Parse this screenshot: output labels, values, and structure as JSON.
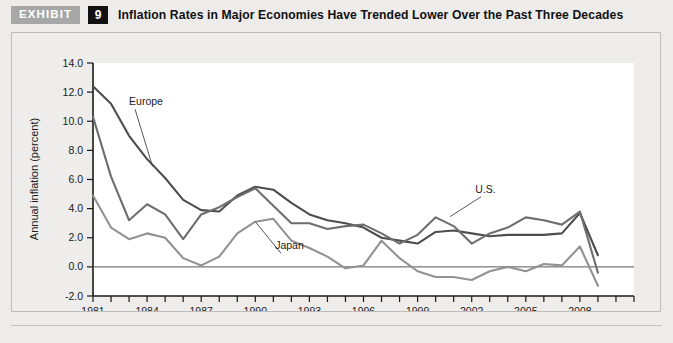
{
  "header": {
    "exhibit_label": "EXHIBIT",
    "exhibit_number": "9",
    "title": "Inflation Rates in Major Economies Have Trended Lower Over the Past Three Decades"
  },
  "colors": {
    "europe": "#4d4d4d",
    "us": "#6e6e6e",
    "japan": "#929292",
    "axis": "#1a1a1a",
    "plot_background": "#ffffff",
    "panel_background": "#eeedeb",
    "badge_gray": "#a7a7a7",
    "badge_black": "#111111"
  },
  "chart_data": {
    "type": "line",
    "title": "Inflation Rates in Major Economies Have Trended Lower Over the Past Three Decades",
    "xlabel": "",
    "ylabel": "Annual inflation (percent)",
    "xlim": [
      1981,
      2011
    ],
    "ylim": [
      -2.0,
      14.0
    ],
    "ytick_labels": [
      "14.0",
      "12.0",
      "10.0",
      "8.0",
      "6.0",
      "4.0",
      "2.0",
      "0.0",
      "-2.0"
    ],
    "yticks": [
      14.0,
      12.0,
      10.0,
      8.0,
      6.0,
      4.0,
      2.0,
      0.0,
      -2.0
    ],
    "xtick_labels": [
      "1981",
      "1984",
      "1987",
      "1990",
      "1993",
      "1996",
      "1999",
      "2002",
      "2005",
      "2008"
    ],
    "xticks": [
      1981,
      1984,
      1987,
      1990,
      1993,
      1996,
      1999,
      2002,
      2005,
      2008
    ],
    "x": [
      1981,
      1982,
      1983,
      1984,
      1985,
      1986,
      1987,
      1988,
      1989,
      1990,
      1991,
      1992,
      1993,
      1994,
      1995,
      1996,
      1997,
      1998,
      1999,
      2000,
      2001,
      2002,
      2003,
      2004,
      2005,
      2006,
      2007,
      2008,
      2009,
      2010
    ],
    "grid": false,
    "legend_position": "inline-annotations",
    "annotations": [
      {
        "text": "Europe",
        "series": "Europe",
        "x": 1983.0,
        "y": 11.1
      },
      {
        "text": "Japan",
        "series": "Japan",
        "x": 1991.1,
        "y": 1.2
      },
      {
        "text": "U.S.",
        "series": "U.S.",
        "x": 2002.2,
        "y": 5.1
      }
    ],
    "series": [
      {
        "name": "Europe",
        "color": "#4d4d4d",
        "values": [
          12.4,
          11.2,
          9.0,
          7.4,
          6.1,
          4.6,
          3.9,
          3.8,
          4.9,
          5.5,
          5.3,
          4.4,
          3.6,
          3.2,
          3.0,
          2.7,
          2.0,
          1.8,
          1.6,
          2.4,
          2.5,
          2.3,
          2.1,
          2.2,
          2.2,
          2.2,
          2.3,
          3.7,
          0.8,
          null
        ]
      },
      {
        "name": "U.S.",
        "color": "#6e6e6e",
        "values": [
          10.3,
          6.2,
          3.2,
          4.3,
          3.6,
          1.9,
          3.6,
          4.1,
          4.8,
          5.4,
          4.2,
          3.0,
          3.0,
          2.6,
          2.8,
          2.9,
          2.3,
          1.6,
          2.2,
          3.4,
          2.8,
          1.6,
          2.3,
          2.7,
          3.4,
          3.2,
          2.9,
          3.8,
          -0.4,
          null
        ]
      },
      {
        "name": "Japan",
        "color": "#929292",
        "values": [
          4.9,
          2.7,
          1.9,
          2.3,
          2.0,
          0.6,
          0.1,
          0.7,
          2.3,
          3.1,
          3.3,
          1.8,
          1.3,
          0.7,
          -0.1,
          0.1,
          1.8,
          0.6,
          -0.3,
          -0.7,
          -0.7,
          -0.9,
          -0.3,
          0.0,
          -0.3,
          0.2,
          0.1,
          1.4,
          -1.3,
          null
        ]
      }
    ]
  }
}
